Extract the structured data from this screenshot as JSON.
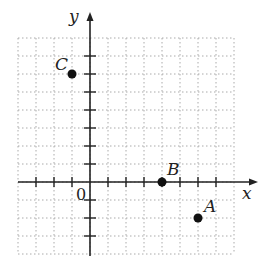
{
  "diagram": {
    "type": "coordinate-plane",
    "axes": {
      "x_label": "x",
      "y_label": "y",
      "origin_label": "0"
    },
    "grid": {
      "x_min": -4,
      "x_max": 8,
      "y_min": -4,
      "y_max": 8,
      "step": 1,
      "style": "dotted"
    },
    "points": [
      {
        "name": "A",
        "x": 6,
        "y": -2
      },
      {
        "name": "B",
        "x": 4,
        "y": 0
      },
      {
        "name": "C",
        "x": -1,
        "y": 6
      }
    ]
  }
}
